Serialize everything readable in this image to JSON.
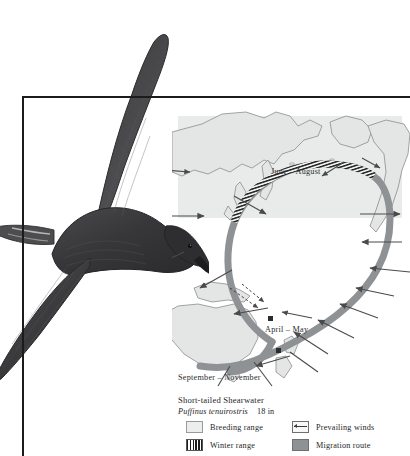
{
  "plate": {
    "kind": "field-guide-migration-plate",
    "background": "#ffffff",
    "frame_color": "#1b1b1b"
  },
  "illustration": {
    "subject": "short-tailed-shearwater-in-flight",
    "plumage_color": "#3a3a3c",
    "alt": "Short-tailed Shearwater gliding with wings raised"
  },
  "map": {
    "ocean_color": "#ffffff",
    "breeding_panel_color": "#e9eaea",
    "landmass_fill": "#e3e5e5",
    "landmass_stroke": "#8b8d8d",
    "route_color": "#8f9295",
    "winter_hatch_color": "#1e1e1e",
    "wind_arrow_color": "#4a4a4a",
    "regions": [
      "Asia",
      "Alaska",
      "North America",
      "New Guinea",
      "Australia",
      "New Zealand"
    ],
    "season_labels": [
      {
        "id": "june-august",
        "text": "June – August"
      },
      {
        "id": "april-may",
        "text": "April – May"
      },
      {
        "id": "september-november",
        "text": "September – November"
      }
    ]
  },
  "caption": {
    "common_name": "Short-tailed Shearwater",
    "scientific_name": "Puffinus tenuirostris",
    "size": "18 in"
  },
  "legend": {
    "items": [
      {
        "id": "breeding-range",
        "label": "Breeding range",
        "swatch": "breeding-range-swatch",
        "color": "#eceded"
      },
      {
        "id": "prevailing-winds",
        "label": "Prevailing winds",
        "swatch": "prevailing-winds-swatch",
        "color": "#3a3a3a"
      },
      {
        "id": "winter-range",
        "label": "Winter range",
        "swatch": "winter-range-swatch",
        "color": "#1e1e1e"
      },
      {
        "id": "migration-route",
        "label": "Migration route",
        "swatch": "migration-route-swatch",
        "color": "#8f9295"
      }
    ]
  }
}
